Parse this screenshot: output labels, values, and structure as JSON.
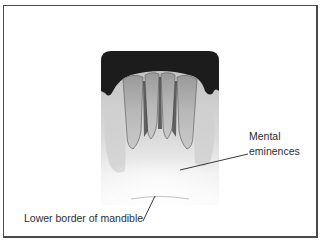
{
  "figure": {
    "labels": {
      "mental_eminences_line1": "Mental",
      "mental_eminences_line2": "eminences",
      "lower_border": "Lower border of mandible"
    }
  },
  "colors": {
    "frame": "#4a4a4a",
    "label_text": "#2e2e2e",
    "film_dark": "#1c1c1c",
    "bone_light": "#e8e8e8"
  }
}
